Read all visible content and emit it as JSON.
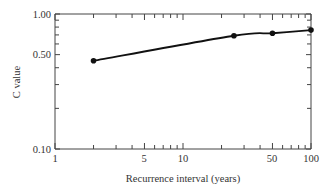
{
  "chart_data": {
    "type": "line",
    "title": "",
    "xlabel": "Recurrence interval (years)",
    "ylabel": "C value",
    "xscale": "log",
    "yscale": "log",
    "xlim": [
      1,
      100
    ],
    "ylim": [
      0.1,
      1.0
    ],
    "x_tick_labels": [
      "1",
      "5",
      "10",
      "50",
      "100"
    ],
    "y_tick_labels": [
      "0.10",
      "0.50",
      "1.00"
    ],
    "grid": false,
    "legend": null,
    "series": [
      {
        "name": "C value",
        "marker": "filled-circle",
        "x": [
          2,
          25,
          50,
          100
        ],
        "values": [
          0.45,
          0.69,
          0.72,
          0.76
        ]
      }
    ]
  },
  "labels": {
    "xlabel": "Recurrence interval (years)",
    "ylabel": "C value",
    "y_ticks": {
      "t100": "1.00",
      "t050": "0.50",
      "t010": "0.10"
    },
    "x_ticks": {
      "t1": "1",
      "t5": "5",
      "t10": "10",
      "t50": "50",
      "t100": "100"
    }
  }
}
